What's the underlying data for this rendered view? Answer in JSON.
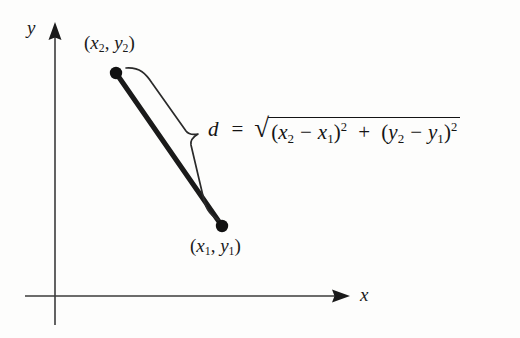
{
  "figure": {
    "background_color": "#fdfdfc",
    "ink_color": "#1a1a1a",
    "axes": {
      "y_label": "y",
      "x_label": "x",
      "origin": {
        "x": 55,
        "y": 296
      },
      "x_axis": {
        "from_x": 25,
        "to_x": 350,
        "y": 296,
        "arrow": "right"
      },
      "y_axis": {
        "x": 55,
        "from_y": 325,
        "to_y": 24,
        "arrow": "up"
      }
    },
    "points": [
      {
        "name": "upper-point",
        "label": "(x2, y2)",
        "label_parts": {
          "open": "(",
          "var1": "x",
          "sub1": "2",
          "sep": ", ",
          "var2": "y",
          "sub2": "2",
          "close": ")"
        },
        "coords": {
          "x": 116,
          "y": 73
        },
        "dot_radius": 6
      },
      {
        "name": "lower-point",
        "label": "(x1, y1)",
        "label_parts": {
          "open": "(",
          "var1": "x",
          "sub1": "1",
          "sep": ", ",
          "var2": "y",
          "sub2": "1",
          "close": ")"
        },
        "coords": {
          "x": 222,
          "y": 226
        },
        "dot_radius": 6
      }
    ],
    "segment": {
      "name": "distance-segment",
      "from": {
        "x": 116,
        "y": 73
      },
      "to": {
        "x": 222,
        "y": 226
      },
      "stroke_width": 5,
      "color": "#1a1a1a"
    },
    "brace": {
      "name": "measurement-brace",
      "orientation": "rotated-parallel-to-segment",
      "tip": {
        "x": 198,
        "y": 134
      },
      "color": "#2a2a2a"
    },
    "formula": {
      "variable": "d",
      "equals": "=",
      "radical_sign": "√",
      "plain_text": "d = √((x2 − x1)² + (y2 − y1)²)",
      "terms": [
        {
          "open": "(",
          "var_a": "x",
          "sub_a": "2",
          "minus": "−",
          "var_b": "x",
          "sub_b": "1",
          "close": ")",
          "power": "2"
        },
        {
          "open": "(",
          "var_a": "y",
          "sub_a": "2",
          "minus": "−",
          "var_b": "y",
          "sub_b": "1",
          "close": ")",
          "power": "2"
        }
      ],
      "plus": "+"
    }
  }
}
